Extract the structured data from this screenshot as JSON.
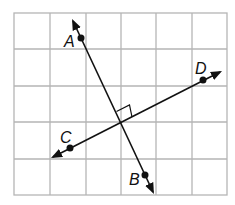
{
  "figure": {
    "type": "perpendicular-lines-on-grid",
    "grid": {
      "columns": 6,
      "rows": 5,
      "color": "#b5b5b5"
    },
    "lines": [
      {
        "name": "line-AB",
        "through": [
          "A",
          "B"
        ]
      },
      {
        "name": "line-CD",
        "through": [
          "C",
          "D"
        ]
      }
    ],
    "right_angle_marker": true,
    "points": [
      {
        "label": "A"
      },
      {
        "label": "B"
      },
      {
        "label": "C"
      },
      {
        "label": "D"
      }
    ],
    "line_color": "#111111"
  }
}
